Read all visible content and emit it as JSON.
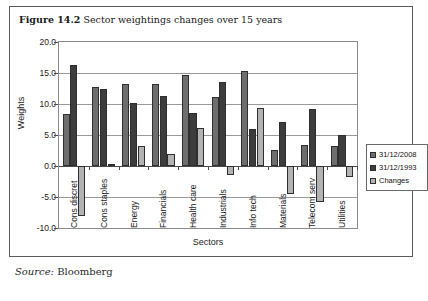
{
  "figure": {
    "label": "Figure 14.2",
    "caption": "Sector weightings changes over 15 years",
    "source_label": "Source:",
    "source_value": "Bloomberg"
  },
  "chart_data": {
    "type": "bar",
    "title": "Sector weightings changes over 15 years",
    "xlabel": "Sectors",
    "ylabel": "Weights",
    "ylim": [
      -10.0,
      20.0
    ],
    "ytick_labels": [
      "20.0",
      "15.0",
      "10.0",
      "5.0",
      "0.0",
      "-5.0",
      "-10.0"
    ],
    "ytick_values": [
      20.0,
      15.0,
      10.0,
      5.0,
      0.0,
      -5.0,
      -10.0
    ],
    "grid": true,
    "legend_position": "right",
    "categories": [
      "Cons discret",
      "Cons staples",
      "Energy",
      "Financials",
      "Health care",
      "Industrials",
      "Info tech",
      "Materials",
      "Telecom serv",
      "Utilities"
    ],
    "series": [
      {
        "name": "31/12/2008",
        "color": "#6e6e6e",
        "values": [
          8.4,
          12.8,
          13.3,
          13.2,
          14.7,
          11.2,
          15.3,
          2.6,
          3.4,
          3.3
        ]
      },
      {
        "name": "31/12/1993",
        "color": "#3d3d3d",
        "values": [
          16.3,
          12.4,
          10.1,
          11.3,
          8.6,
          13.6,
          5.9,
          7.1,
          9.2,
          5.0
        ]
      },
      {
        "name": "Changes",
        "color": "#b3b3b3",
        "values": [
          -8.0,
          0.3,
          3.3,
          1.9,
          6.1,
          -1.5,
          9.3,
          -4.5,
          -5.8,
          -1.7
        ]
      }
    ]
  }
}
